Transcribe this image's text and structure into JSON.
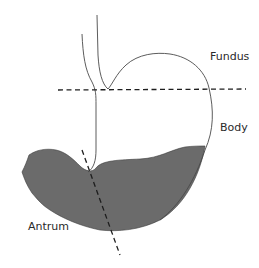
{
  "diagram": {
    "title": "",
    "labels": {
      "fundus": "Fundus",
      "body": "Body",
      "antrum": "Antrum"
    },
    "colors": {
      "background": "#ffffff",
      "outline": "#4a4a4a",
      "contents_fill": "#6b6b6b",
      "dashed_line": "#1e1e1e",
      "label_text": "#2a2a2a"
    },
    "divisions": [
      {
        "name": "fundus-body-boundary",
        "style": "dashed",
        "orientation": "horizontal"
      },
      {
        "name": "body-antrum-boundary",
        "style": "dashed",
        "orientation": "diagonal"
      }
    ],
    "shaded_region": "gastric-contents"
  }
}
